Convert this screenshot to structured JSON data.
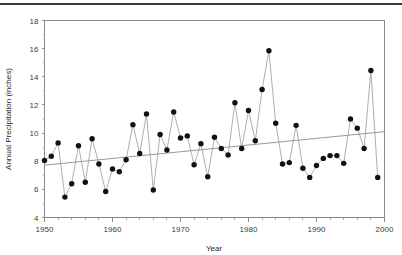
{
  "figure": {
    "has_top_rule": true,
    "background": "#ffffff"
  },
  "axis": {
    "y_title": "Annual Precipitation (inches)",
    "x_title": "Year",
    "y_ticks": [
      "4",
      "6",
      "8",
      "10",
      "12",
      "14",
      "16",
      "18"
    ],
    "x_ticks": [
      "1950",
      "1960",
      "1970",
      "1980",
      "1990",
      "2000"
    ]
  },
  "chart_data": {
    "type": "line",
    "title": "",
    "subtitle": "",
    "xlabel": "Year",
    "ylabel": "Annual Precipitation (inches)",
    "xlim": [
      1950,
      2000
    ],
    "ylim": [
      4,
      18
    ],
    "y_tick_values": [
      4,
      6,
      8,
      10,
      12,
      14,
      16,
      18
    ],
    "x_tick_values": [
      1950,
      1960,
      1970,
      1980,
      1990,
      2000
    ],
    "x_minor_tick_step": 2,
    "grid": false,
    "legend": null,
    "legend_position": "none",
    "marker": "filled-circle",
    "marker_color": "#111111",
    "line_color": "#9a9a9a",
    "series": [
      {
        "name": "Annual Precipitation",
        "x": [
          1950,
          1951,
          1952,
          1953,
          1954,
          1955,
          1956,
          1957,
          1958,
          1959,
          1960,
          1961,
          1962,
          1963,
          1964,
          1965,
          1966,
          1967,
          1968,
          1969,
          1970,
          1971,
          1972,
          1973,
          1974,
          1975,
          1976,
          1977,
          1978,
          1979,
          1980,
          1981,
          1982,
          1983,
          1984,
          1985,
          1986,
          1987,
          1988,
          1989,
          1990,
          1991,
          1992,
          1993,
          1994,
          1995,
          1996,
          1997,
          1998,
          1999
        ],
        "values": [
          8.05,
          8.35,
          9.3,
          5.45,
          6.4,
          9.1,
          6.5,
          9.6,
          7.8,
          5.85,
          7.45,
          7.25,
          8.1,
          10.6,
          8.55,
          11.35,
          5.95,
          9.9,
          8.8,
          11.5,
          9.65,
          9.8,
          7.75,
          9.25,
          6.9,
          9.7,
          8.9,
          8.45,
          12.15,
          8.9,
          11.6,
          9.45,
          13.1,
          15.85,
          10.7,
          7.8,
          7.9,
          10.55,
          7.5,
          6.85,
          7.7,
          8.2,
          8.4,
          8.4,
          7.85,
          11.0,
          10.35,
          8.9,
          14.45,
          6.85
        ]
      }
    ],
    "trend_line": {
      "name": "Linear trend",
      "x": [
        1950,
        2000
      ],
      "values": [
        7.72,
        10.1
      ],
      "color": "#8d8d8d"
    }
  }
}
